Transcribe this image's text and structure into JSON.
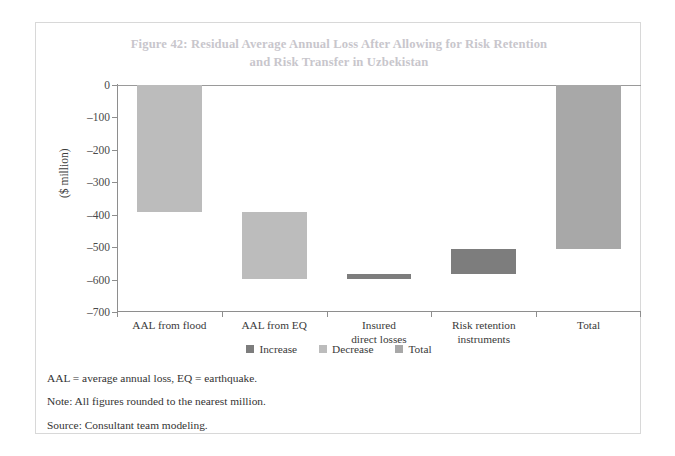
{
  "figure": {
    "title_line1": "Figure 42: Residual Average Annual Loss After Allowing for Risk Retention",
    "title_line2": "and Risk Transfer in Uzbekistan"
  },
  "notes": [
    "AAL = average annual loss, EQ = earthquake.",
    "Note: All figures rounded to the nearest million.",
    "Source: Consultant team modeling."
  ],
  "colors": {
    "increase": "#7d7d7d",
    "decrease": "#bcbcbc",
    "total": "#a8a8a8",
    "axis": "#8e8e8e",
    "title": "#c8c6cc",
    "frame": "#d8d8d8",
    "text": "#3a3a3a"
  },
  "chart_data": {
    "type": "bar",
    "chart_subtype": "waterfall",
    "title": "Figure 42: Residual Average Annual Loss After Allowing for Risk Retention and Risk Transfer in Uzbekistan",
    "xlabel": "",
    "ylabel": "($ million)",
    "ylim": [
      -700,
      0
    ],
    "ytick_values": [
      0,
      -100,
      -200,
      -300,
      -400,
      -500,
      -600,
      -700
    ],
    "ytick_labels": [
      "0",
      "–100",
      "–200",
      "–300",
      "–400",
      "–500",
      "–600",
      "–700"
    ],
    "grid": false,
    "legend_position": "bottom-center",
    "legend": [
      {
        "label": "Increase",
        "color": "#7d7d7d"
      },
      {
        "label": "Decrease",
        "color": "#bcbcbc"
      },
      {
        "label": "Total",
        "color": "#a8a8a8"
      }
    ],
    "categories": [
      "AAL from flood",
      "AAL from EQ",
      "Insured\ndirect losses",
      "Risk retention\ninstruments",
      "Total"
    ],
    "category_labels": [
      [
        "AAL from flood"
      ],
      [
        "AAL from EQ"
      ],
      [
        "Insured",
        "direct losses"
      ],
      [
        "Risk retention",
        "instruments"
      ],
      [
        "Total"
      ]
    ],
    "bars": [
      {
        "category": "AAL from flood",
        "type": "decrease",
        "value": -393,
        "start": 0,
        "end": -393
      },
      {
        "category": "AAL from EQ",
        "type": "decrease",
        "value": -206,
        "start": -393,
        "end": -599
      },
      {
        "category": "Insured direct losses",
        "type": "increase",
        "value": 17,
        "start": -599,
        "end": -582
      },
      {
        "category": "Risk retention instruments",
        "type": "increase",
        "value": 75,
        "start": -582,
        "end": -507
      },
      {
        "category": "Total",
        "type": "total",
        "value": -507,
        "start": 0,
        "end": -507
      }
    ]
  }
}
